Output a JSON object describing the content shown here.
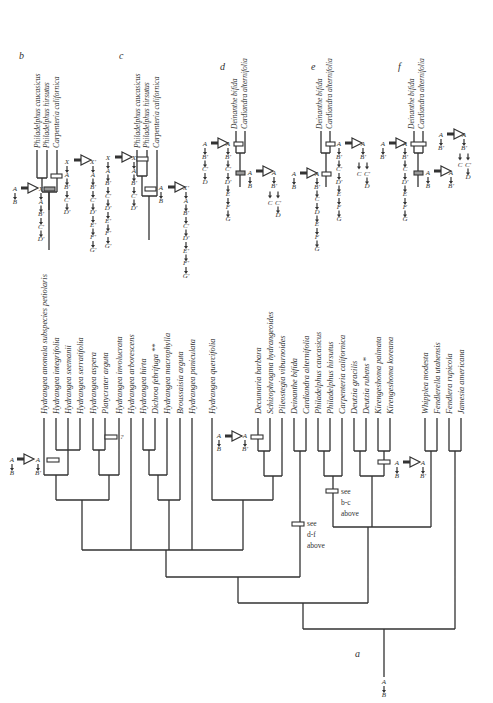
{
  "figure": {
    "panel_labels": {
      "a": "a",
      "b": "b",
      "c": "c",
      "d": "d",
      "e": "e",
      "f": "f"
    },
    "main_tree": {
      "taxa": [
        {
          "name": "Hydrangea anomala subspecies petiolaris",
          "x": 44
        },
        {
          "name": "Hydrangea integrifolia",
          "x": 56
        },
        {
          "name": "Hydrangea seemanii",
          "x": 68
        },
        {
          "name": "Hydrangea serratifolia",
          "x": 80
        },
        {
          "name": "Hydrangea aspera",
          "x": 93
        },
        {
          "name": "Platycrater arguta",
          "x": 105
        },
        {
          "name": "Hydrangea involucrata",
          "x": 119
        },
        {
          "name": "Hydrangea arborescens",
          "x": 131
        },
        {
          "name": "Hydrangea hirta",
          "x": 143
        },
        {
          "name": "Dichroa febrifuga **",
          "x": 155
        },
        {
          "name": "Hydrangea macrophylla",
          "x": 167
        },
        {
          "name": "Broussaisia arguta",
          "x": 180
        },
        {
          "name": "Hydrangea paniculata",
          "x": 192
        },
        {
          "name": "Hydrangea quercifolia",
          "x": 212
        },
        {
          "name": "Decumaria barbara",
          "x": 258
        },
        {
          "name": "Schizophragma hydrangeoides",
          "x": 270
        },
        {
          "name": "Pileostegia viburnoides",
          "x": 282
        },
        {
          "name": "Deinanthe bifida",
          "x": 294
        },
        {
          "name": "Cardiandra alternifolia",
          "x": 306
        },
        {
          "name": "Philadelphus caucasicus",
          "x": 318
        },
        {
          "name": "Philadelphus hirsutus",
          "x": 330
        },
        {
          "name": "Carpenteria californica",
          "x": 342
        },
        {
          "name": "Deutzia gracilis",
          "x": 354
        },
        {
          "name": "Deutzia rubens *",
          "x": 366
        },
        {
          "name": "Kirengeshoma palmata",
          "x": 378
        },
        {
          "name": "Kirengeshoma koreana",
          "x": 390
        },
        {
          "name": "Whipplea modesta",
          "x": 425
        },
        {
          "name": "Fendlerella utahensis",
          "x": 437
        },
        {
          "name": "Fendlera rupicola",
          "x": 449
        },
        {
          "name": "Jamesia americana",
          "x": 461
        }
      ],
      "annotations": {
        "hydrangea_anomala": {
          "from": "A",
          "to": "A",
          "from_below": "B",
          "to_below": "B'"
        },
        "platycrater": {
          "mark": "?"
        },
        "decumaria": {
          "from": "A",
          "to": "A",
          "from_below": "B",
          "to_below": "B'"
        },
        "kirengeshoma": {
          "from": "A",
          "to": "A",
          "from_below": "B",
          "to_below": "B'"
        },
        "see_df": [
          "see",
          "d-f",
          "above"
        ],
        "see_bc": [
          "see",
          "b-c",
          "above"
        ],
        "root": {
          "top": "A",
          "bottom": "B"
        }
      }
    },
    "inset_b": {
      "taxa": [
        "Philadelphus caucasicus",
        "Philadelphus hirsutus",
        "Carpenteria californica"
      ],
      "lower_from": [
        "A",
        "B"
      ],
      "lower_to": [
        "X",
        "A",
        "B'",
        "C'",
        "D'"
      ],
      "upper_from": [
        "X",
        "A",
        "B'",
        "C'",
        "D'"
      ],
      "upper_to": [
        "X'",
        "A",
        "B'",
        "C'",
        "D'",
        "E'",
        "F'",
        "G'"
      ]
    },
    "inset_c": {
      "taxa": [
        "Philadelphus caucasicus",
        "Philadelphus hirsutus",
        "Carpenteria californica"
      ],
      "upper_from": [
        "X",
        "A",
        "B'",
        "C'",
        "D'",
        "E'",
        "F'",
        "G'"
      ],
      "upper_to": [
        "X",
        "A",
        "B'",
        "C'",
        "D'"
      ],
      "lower_from": [
        "A",
        "B"
      ],
      "lower_to": [
        "X'",
        "A",
        "B'",
        "C'",
        "D'",
        "E'",
        "F'",
        "G'"
      ]
    },
    "inset_d": {
      "taxa": [
        "Deinanthe bifida",
        "Cardiandra alternifolia"
      ],
      "upper_from": [
        "A",
        "B'",
        "C'",
        "D"
      ],
      "upper_to": [
        "A",
        "B'",
        "C'",
        "D'",
        "E",
        "F",
        "G"
      ],
      "lower_from": [
        "A",
        "B"
      ],
      "lower_to": {
        "top": [
          "A",
          "B'"
        ],
        "left": [
          "C"
        ],
        "right": [
          "C'",
          "D"
        ]
      }
    },
    "inset_e": {
      "taxa": [
        "Deinanthe bifida",
        "Cardiandra alternifolia"
      ],
      "lower_from": [
        "A",
        "B"
      ],
      "lower_to": [
        "A",
        "B'",
        "C",
        "D",
        "E",
        "F",
        "G"
      ],
      "upper_from": [
        "A",
        "B'",
        "C'",
        "D'",
        "E",
        "F",
        "G"
      ],
      "upper_to": {
        "top": [
          "A",
          "B'"
        ],
        "left": [
          "C"
        ],
        "right": [
          "C'",
          "D"
        ]
      }
    },
    "inset_f": {
      "taxa": [
        "Deinanthe bifida",
        "Cardiandra alternifolia"
      ],
      "upper_from": [
        "A",
        "B'"
      ],
      "upper_to": [
        "A",
        "B'",
        "C",
        "D'",
        "E",
        "F",
        "G"
      ],
      "side_from": [
        "A",
        "B'"
      ],
      "side_to": {
        "top": [
          "A",
          "B'"
        ],
        "left": [
          "C"
        ],
        "right": [
          "C'",
          "D"
        ]
      },
      "lower_from": [
        "A",
        "B"
      ],
      "lower_to": [
        "A",
        "B'"
      ]
    },
    "colors": {
      "line": "#333333",
      "grey_bar": "#999999",
      "background": "#ffffff"
    }
  }
}
